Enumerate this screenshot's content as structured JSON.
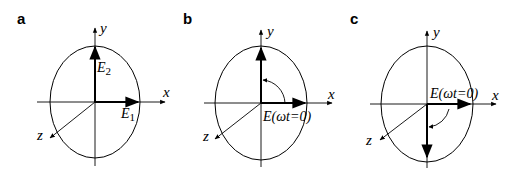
{
  "figure": {
    "panels": [
      {
        "id": "a",
        "label": "a",
        "axes": {
          "x": "x",
          "y": "y",
          "z": "z"
        },
        "vectors": [
          {
            "name": "E",
            "sub": "2",
            "direction": "+y"
          },
          {
            "name": "E",
            "sub": "1",
            "direction": "+x"
          }
        ]
      },
      {
        "id": "b",
        "label": "b",
        "axes": {
          "x": "x",
          "y": "y",
          "z": "z"
        },
        "vector_label": "E(ωt=0)",
        "rotation": "counterclockwise, +x to +y"
      },
      {
        "id": "c",
        "label": "c",
        "axes": {
          "x": "x",
          "y": "y",
          "z": "z"
        },
        "vector_label": "E(ωt=0)",
        "rotation": "clockwise, +x to -y"
      }
    ]
  }
}
